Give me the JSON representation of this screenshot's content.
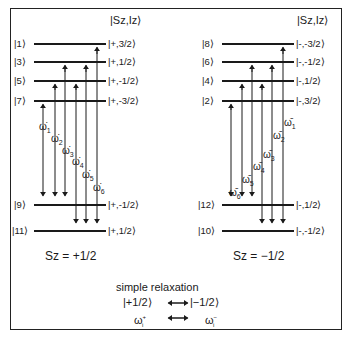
{
  "diagram": {
    "left_panel": {
      "header": "|S_Z,I_Z⟩",
      "header_text": "|Sz,Iz⟩",
      "spin_label": "Sz = +1/2",
      "levels": [
        {
          "index": "|1⟩",
          "state": "|+,3/2⟩"
        },
        {
          "index": "|3⟩",
          "state": "|+,1/2⟩"
        },
        {
          "index": "|5⟩",
          "state": "|+,-1/2⟩"
        },
        {
          "index": "|7⟩",
          "state": "|+,-3/2⟩"
        },
        {
          "index": "|9⟩",
          "state": "|+,-1/2⟩"
        },
        {
          "index": "|11⟩",
          "state": "|+,1/2⟩"
        }
      ],
      "transitions": [
        {
          "label": "ω̇",
          "sub": "1",
          "from": "|7⟩",
          "to": "|9⟩"
        },
        {
          "label": "ω̇",
          "sub": "2",
          "from": "|5⟩",
          "to": "|9⟩"
        },
        {
          "label": "ω̇",
          "sub": "3",
          "from": "|3⟩",
          "to": "|9⟩"
        },
        {
          "label": "ω̇",
          "sub": "4",
          "from": "|5⟩",
          "to": "|11⟩"
        },
        {
          "label": "ω̇",
          "sub": "5",
          "from": "|3⟩",
          "to": "|11⟩"
        },
        {
          "label": "ω̇",
          "sub": "6",
          "from": "|1⟩",
          "to": "|11⟩"
        }
      ]
    },
    "right_panel": {
      "header_text": "|Sz,Iz⟩",
      "spin_label": "Sz = −1/2",
      "levels": [
        {
          "index": "|8⟩",
          "state": "|-,-3/2⟩"
        },
        {
          "index": "|6⟩",
          "state": "|-,-1/2⟩"
        },
        {
          "index": "|4⟩",
          "state": "|-,1/2⟩"
        },
        {
          "index": "|2⟩",
          "state": "|-,3/2⟩"
        },
        {
          "index": "|12⟩",
          "state": "|-,1/2⟩"
        },
        {
          "index": "|10⟩",
          "state": "|-,-1/2⟩"
        }
      ],
      "transitions": [
        {
          "label": "ω̄",
          "sub": "1",
          "from": "|8⟩",
          "to": "|10⟩"
        },
        {
          "label": "ω̄",
          "sub": "2",
          "from": "|6⟩",
          "to": "|10⟩"
        },
        {
          "label": "ω̄",
          "sub": "3",
          "from": "|4⟩",
          "to": "|10⟩"
        },
        {
          "label": "ω̄",
          "sub": "4",
          "from": "|6⟩",
          "to": "|12⟩"
        },
        {
          "label": "ω̄",
          "sub": "5",
          "from": "|4⟩",
          "to": "|12⟩"
        },
        {
          "label": "ω̄",
          "sub": "6",
          "from": "|2⟩",
          "to": "|12⟩"
        }
      ]
    },
    "legend": {
      "title": "simple relaxation",
      "row1_left": "|+1/2⟩",
      "row1_right": "|−1/2⟩",
      "row2_left": "ω",
      "row2_left_sup": "+",
      "row2_left_sub": "i",
      "row2_right": "ω",
      "row2_right_sup": "−",
      "row2_right_sub": "i"
    }
  }
}
